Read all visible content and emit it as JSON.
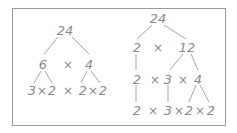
{
  "diagram": {
    "left_tree": {
      "root": "24",
      "level1": [
        "6",
        "×",
        "4"
      ],
      "level2": [
        "3×2",
        "×",
        "2×2"
      ],
      "nodes": {
        "root": "24",
        "l1_a": "6",
        "l1_op": "×",
        "l1_b": "4",
        "l2_a1": "3",
        "l2_a_op": "×",
        "l2_a2": "2",
        "l2_op": "×",
        "l2_b1": "2",
        "l2_b_op": "×",
        "l2_b2": "2"
      }
    },
    "right_tree": {
      "root": "24",
      "level1": [
        "2",
        "×",
        "12"
      ],
      "level2": [
        "2",
        "×",
        "3",
        "×",
        "4"
      ],
      "level3": [
        "2",
        "×",
        "3",
        "×",
        "2",
        "×",
        "2"
      ],
      "nodes": {
        "root": "24",
        "l1_a": "2",
        "l1_op": "×",
        "l1_b": "12",
        "l2_a": "2",
        "l2_op1": "×",
        "l2_b": "3",
        "l2_op2": "×",
        "l2_c": "4",
        "l3_a": "2",
        "l3_op1": "×",
        "l3_b": "3",
        "l3_op2": "×",
        "l3_c": "2",
        "l3_op3": "×",
        "l3_d": "2"
      }
    },
    "colors": {
      "text": "#8a8a8a",
      "lines": "#a5a5a5",
      "border": "#9a9a9a"
    }
  }
}
